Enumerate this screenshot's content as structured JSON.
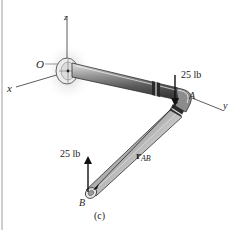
{
  "figure": {
    "caption": "(c)",
    "axes": {
      "x": "x",
      "y": "y",
      "z": "z",
      "origin": "O"
    },
    "points": {
      "A": "A",
      "B": "B"
    },
    "forces": [
      {
        "id": "force_A",
        "label": "25 lb",
        "direction": "down",
        "at": "A"
      },
      {
        "id": "force_B",
        "label": "25 lb",
        "direction": "up",
        "at": "B"
      }
    ],
    "vector": {
      "symbol": "r",
      "subscript": "AB"
    }
  },
  "colors": {
    "pipe_dark": "#4a4a4a",
    "pipe_mid": "#8a8a8a",
    "pipe_light": "#d8d8d8",
    "shadow": "#c8c8c8",
    "line": "#222222"
  }
}
